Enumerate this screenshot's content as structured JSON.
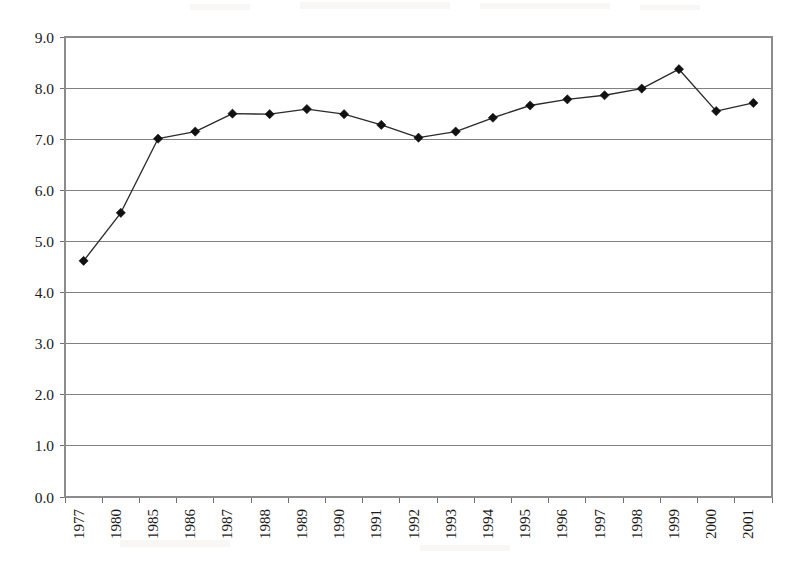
{
  "chart_data": {
    "type": "line",
    "title": "",
    "subtitle": "",
    "xlabel": "",
    "ylabel": "",
    "categories": [
      "1977",
      "1980",
      "1985",
      "1986",
      "1987",
      "1988",
      "1989",
      "1990",
      "1991",
      "1992",
      "1993",
      "1994",
      "1995",
      "1996",
      "1997",
      "1998",
      "1999",
      "2000",
      "2001"
    ],
    "values": [
      4.62,
      5.56,
      7.01,
      7.15,
      7.5,
      7.49,
      7.59,
      7.49,
      7.28,
      7.03,
      7.15,
      7.42,
      7.66,
      7.78,
      7.86,
      7.99,
      8.37,
      7.55,
      7.71
    ],
    "series": [
      {
        "name": "series-1",
        "values": [
          4.62,
          5.56,
          7.01,
          7.15,
          7.5,
          7.49,
          7.59,
          7.49,
          7.28,
          7.03,
          7.15,
          7.42,
          7.66,
          7.78,
          7.86,
          7.99,
          8.37,
          7.55,
          7.71
        ]
      }
    ],
    "ylim": [
      0.0,
      9.0
    ],
    "ytick_step": 1.0,
    "ytick_labels": [
      "9.0",
      "8.0",
      "7.0",
      "6.0",
      "5.0",
      "4.0",
      "3.0",
      "2.0",
      "1.0",
      "0.0"
    ],
    "ytick_values": [
      9.0,
      8.0,
      7.0,
      6.0,
      5.0,
      4.0,
      3.0,
      2.0,
      1.0,
      0.0
    ],
    "grid": true,
    "grid_axis": "y",
    "legend": false,
    "legend_position": "none",
    "marker": "diamond",
    "line_color": "#2b2b2b",
    "marker_color": "#111111",
    "grid_color": "#808080",
    "background_color": "#ffffff",
    "xtick_label_rotation": -90
  },
  "layout": {
    "plot_left": 65,
    "plot_right": 772,
    "plot_top": 37,
    "plot_bottom": 497
  }
}
